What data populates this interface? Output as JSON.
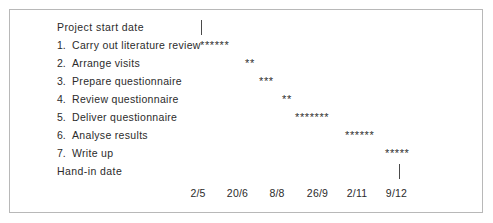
{
  "chart_data": {
    "type": "bar",
    "title": "",
    "xlabel": "",
    "ylabel": "",
    "orientation": "horizontal",
    "axis_tick_labels": [
      "2/5",
      "20/6",
      "8/8",
      "26/9",
      "2/11",
      "9/12"
    ],
    "axis_tick_x": [
      198,
      237.5,
      277,
      317.5,
      357,
      396.5
    ],
    "rows": [
      {
        "id": "project-start-date",
        "number": "",
        "label": "Project start date",
        "marker": "tick",
        "marker_x": 201,
        "stars": 0,
        "bar": ""
      },
      {
        "id": "carry-out-literature-review",
        "number": "1.",
        "label": "Carry out literature review",
        "marker": "stars",
        "bar_x": 200,
        "stars": 6,
        "bar": "******"
      },
      {
        "id": "arrange-visits",
        "number": "2.",
        "label": "Arrange visits",
        "marker": "stars",
        "bar_x": 245,
        "stars": 2,
        "bar": "**"
      },
      {
        "id": "prepare-questionnaire",
        "number": "3.",
        "label": "Prepare questionnaire",
        "marker": "stars",
        "bar_x": 259,
        "stars": 3,
        "bar": "***"
      },
      {
        "id": "review-questionnaire",
        "number": "4.",
        "label": "Review questionnaire",
        "marker": "stars",
        "bar_x": 282,
        "stars": 2,
        "bar": "**"
      },
      {
        "id": "deliver-questionnaire",
        "number": "5.",
        "label": "Deliver questionnaire",
        "marker": "stars",
        "bar_x": 295,
        "stars": 7,
        "bar": "*******"
      },
      {
        "id": "analyse-results",
        "number": "6.",
        "label": "Analyse results",
        "marker": "stars",
        "bar_x": 345,
        "stars": 6,
        "bar": "******"
      },
      {
        "id": "write-up",
        "number": "7.",
        "label": "Write up",
        "marker": "stars",
        "bar_x": 385,
        "stars": 5,
        "bar": "*****"
      },
      {
        "id": "hand-in-date",
        "number": "",
        "label": "Hand-in date",
        "marker": "tick",
        "marker_x": 399,
        "stars": 0,
        "bar": ""
      }
    ]
  },
  "colors": {
    "border": "#b8b8b8",
    "text": "#2b2b2b",
    "bar": "#2f2f2f",
    "tick": "#4a4a4a",
    "background": "#ffffff"
  }
}
